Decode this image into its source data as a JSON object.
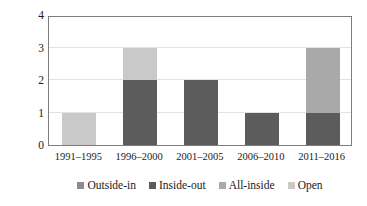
{
  "chart_data": {
    "type": "bar",
    "subtype": "stacked-bar",
    "title": "",
    "subtitle": "",
    "xlabel": "",
    "ylabel": "Number of papers",
    "categories": [
      "1991–1995",
      "1996–2000",
      "2001–2005",
      "2006–2010",
      "2011–2016"
    ],
    "series": [
      {
        "name": "Outside-in",
        "color": "#8c8c8c",
        "values": [
          0,
          0,
          0,
          0,
          0
        ]
      },
      {
        "name": "Inside-out",
        "color": "#5c5c5c",
        "values": [
          0,
          2,
          2,
          1,
          1
        ]
      },
      {
        "name": "All-inside",
        "color": "#a9a9a9",
        "values": [
          0,
          0,
          0,
          0,
          2
        ]
      },
      {
        "name": "Open",
        "color": "#c9c9c9",
        "values": [
          1,
          1,
          0,
          0,
          0
        ]
      }
    ],
    "totals": [
      1,
      3,
      2,
      1,
      3
    ],
    "ylim": [
      0,
      4
    ],
    "yticks": [
      0,
      1,
      2,
      3,
      4
    ],
    "ytick_labels": [
      "0",
      "1",
      "2",
      "3",
      "4"
    ],
    "grid": true,
    "grid_axis": "y",
    "legend_position": "bottom",
    "legend_entries": [
      "Outside-in",
      "Inside-out",
      "All-inside",
      "Open"
    ],
    "annotations": []
  },
  "axes": {
    "y_title": "Number of papers",
    "y_tick_labels": [
      "4",
      "3",
      "2",
      "1",
      "0"
    ],
    "x_tick_labels": [
      "1991–1995",
      "1996–2000",
      "2001–2005",
      "2006–2010",
      "2011–2016"
    ]
  },
  "legend": {
    "items": [
      {
        "label": "Outside-in",
        "color": "#8c8c8c"
      },
      {
        "label": "Inside-out",
        "color": "#5c5c5c"
      },
      {
        "label": "All-inside",
        "color": "#a9a9a9"
      },
      {
        "label": "Open",
        "color": "#c9c9c9"
      }
    ]
  },
  "colors": {
    "plot_border": "#7d7d7d",
    "gridline": "#e2e2e2",
    "background": "#ffffff",
    "text": "#1a1a1a"
  }
}
